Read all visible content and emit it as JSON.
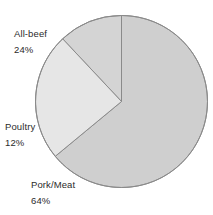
{
  "chart_data": {
    "type": "pie",
    "title": "",
    "subtitle": "",
    "xlabel": "",
    "ylabel": "",
    "legend_position": "none",
    "grid": false,
    "labels_outside": true,
    "start_angle_deg": 0,
    "direction": "clockwise",
    "categories": [
      "Pork/Meat",
      "All-beef",
      "Poultry"
    ],
    "values": [
      64,
      24,
      12
    ],
    "unit": "%",
    "slices": [
      {
        "name": "Pork/Meat",
        "value": 64,
        "value_text": "64%",
        "color": "#cfcfcf",
        "start_deg": 0,
        "end_deg": 230.4
      },
      {
        "name": "Poultry",
        "value": 12,
        "value_text": "12%",
        "color": "#d4d4d4",
        "start_deg": 230.4,
        "end_deg": 273.6
      },
      {
        "name": "All-beef",
        "value": 24,
        "value_text": "24%",
        "color": "#e6e6e6",
        "start_deg": 273.6,
        "end_deg": 360
      }
    ]
  },
  "labels": {
    "allbeef": {
      "name": "All-beef",
      "percent": "24%"
    },
    "poultry": {
      "name": "Poultry",
      "percent": "12%"
    },
    "porkmeat": {
      "name": "Pork/Meat",
      "percent": "64%"
    }
  },
  "colors": {
    "slice_pork": "#cfcfcf",
    "slice_poultry": "#d4d4d4",
    "slice_allbeef": "#e6e6e6",
    "slice_outline": "#8a8a8a",
    "text": "#2b2b2b",
    "background": "#ffffff"
  }
}
